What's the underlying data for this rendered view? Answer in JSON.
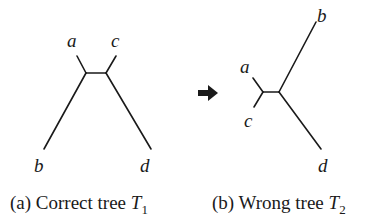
{
  "figure": {
    "arrow": {
      "icon": "right-arrow-icon",
      "color": "#1a1a1a"
    },
    "trees": [
      {
        "id": "T1",
        "caption": {
          "prefix": "(a) Correct tree ",
          "var": "T",
          "subscript": "1"
        },
        "leaves": {
          "a": "a",
          "b": "b",
          "c": "c",
          "d": "d"
        },
        "topology": "((a,b),(c,d))"
      },
      {
        "id": "T2",
        "caption": {
          "prefix": "(b) Wrong tree ",
          "var": "T",
          "subscript": "2"
        },
        "leaves": {
          "a": "a",
          "b": "b",
          "c": "c",
          "d": "d"
        },
        "topology": "((a,c),(b,d))"
      }
    ]
  }
}
